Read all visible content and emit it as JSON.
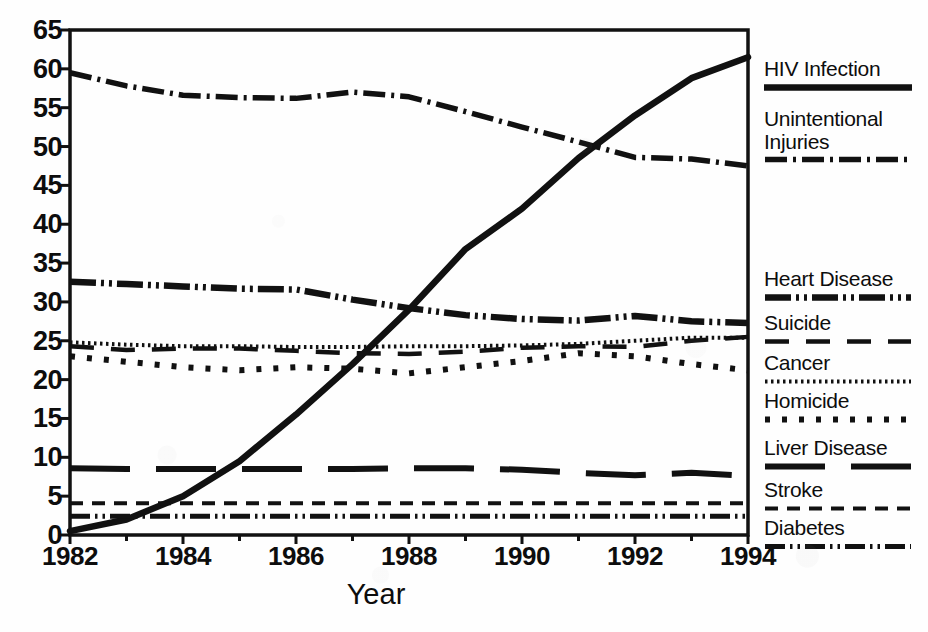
{
  "chart_data": {
    "type": "line",
    "title": "",
    "xlabel": "Year",
    "ylabel": "",
    "xlim": [
      1982,
      1994
    ],
    "ylim": [
      0,
      65
    ],
    "ytick_step": 5,
    "grid": false,
    "legend_position": "right",
    "x": [
      1982,
      1983,
      1984,
      1985,
      1986,
      1987,
      1988,
      1989,
      1990,
      1991,
      1992,
      1993,
      1994
    ],
    "xtick_labels": [
      "1982",
      "1984",
      "1986",
      "1988",
      "1990",
      "1992",
      "1994"
    ],
    "ytick_labels": [
      "0",
      "5",
      "10",
      "15",
      "20",
      "25",
      "30",
      "35",
      "40",
      "45",
      "50",
      "55",
      "60",
      "65"
    ],
    "series": [
      {
        "name": "HIV Infection",
        "style": "solid",
        "values": [
          0.5,
          2.0,
          5.0,
          9.5,
          15.5,
          22.0,
          29.0,
          36.8,
          42.0,
          48.5,
          54.0,
          58.8,
          61.5
        ]
      },
      {
        "name": "Unintentional Injuries",
        "style": "dash-dot",
        "values": [
          59.5,
          57.8,
          56.6,
          56.3,
          56.2,
          57.0,
          56.4,
          54.5,
          52.5,
          50.6,
          48.6,
          48.4,
          47.5
        ]
      },
      {
        "name": "Heart Disease",
        "style": "dash-dot-dot",
        "values": [
          32.6,
          32.3,
          32.0,
          31.7,
          31.6,
          30.3,
          29.2,
          28.3,
          27.8,
          27.6,
          28.2,
          27.5,
          27.3
        ]
      },
      {
        "name": "Suicide",
        "style": "long-dash",
        "values": [
          24.3,
          23.8,
          24.0,
          24.0,
          23.7,
          23.4,
          23.3,
          23.6,
          24.1,
          24.3,
          24.2,
          25.0,
          25.5
        ]
      },
      {
        "name": "Cancer",
        "style": "fine-dotted",
        "values": [
          24.8,
          24.5,
          24.3,
          24.3,
          24.2,
          24.2,
          24.3,
          24.3,
          24.4,
          24.6,
          25.0,
          25.4,
          25.4
        ]
      },
      {
        "name": "Homicide",
        "style": "bold-dotted",
        "values": [
          23.0,
          22.3,
          21.6,
          21.2,
          21.6,
          21.4,
          20.8,
          21.6,
          22.4,
          23.4,
          23.0,
          22.0,
          21.2
        ]
      },
      {
        "name": "Liver Disease",
        "style": "long-dash-solid",
        "values": [
          8.6,
          8.5,
          8.5,
          8.5,
          8.5,
          8.5,
          8.6,
          8.6,
          8.4,
          8.0,
          7.7,
          8.0,
          7.6
        ]
      },
      {
        "name": "Stroke",
        "style": "medium-dash",
        "values": [
          4.1,
          4.1,
          4.1,
          4.1,
          4.1,
          4.1,
          4.1,
          4.1,
          4.1,
          4.1,
          4.1,
          4.1,
          4.1
        ]
      },
      {
        "name": "Diabetes",
        "style": "dash-dot-dot-fine",
        "values": [
          2.4,
          2.4,
          2.4,
          2.4,
          2.4,
          2.4,
          2.4,
          2.4,
          2.4,
          2.4,
          2.4,
          2.4,
          2.4
        ]
      }
    ]
  },
  "legend": {
    "entries": [
      {
        "label": "HIV Infection",
        "style": "solid",
        "top": 58
      },
      {
        "label": "Unintentional\nInjuries",
        "style": "dash-dot",
        "top": 108
      },
      {
        "label": "Heart Disease",
        "style": "dash-dot-dot",
        "top": 268
      },
      {
        "label": "Suicide",
        "style": "long-dash",
        "top": 312
      },
      {
        "label": "Cancer",
        "style": "fine-dotted",
        "top": 352
      },
      {
        "label": "Homicide",
        "style": "bold-dotted",
        "top": 390
      },
      {
        "label": "Liver Disease",
        "style": "long-dash-solid",
        "top": 437
      },
      {
        "label": "Stroke",
        "style": "medium-dash",
        "top": 479
      },
      {
        "label": "Diabetes",
        "style": "dash-dot-dot-fine",
        "top": 517
      }
    ]
  },
  "axis": {
    "x_title": "Year",
    "ink_color": "#111111"
  }
}
